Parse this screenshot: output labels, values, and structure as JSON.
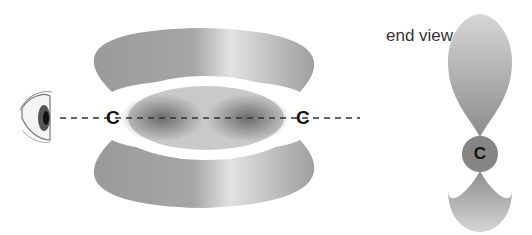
{
  "diagram": {
    "side_view": {
      "atoms": [
        {
          "label": "C"
        },
        {
          "label": "C"
        }
      ]
    },
    "end_view": {
      "title": "end view",
      "atom": {
        "label": "C"
      }
    },
    "colors": {
      "lobe": "#8f8f8f",
      "atom_disc": "#858585",
      "text": "#111111"
    }
  }
}
